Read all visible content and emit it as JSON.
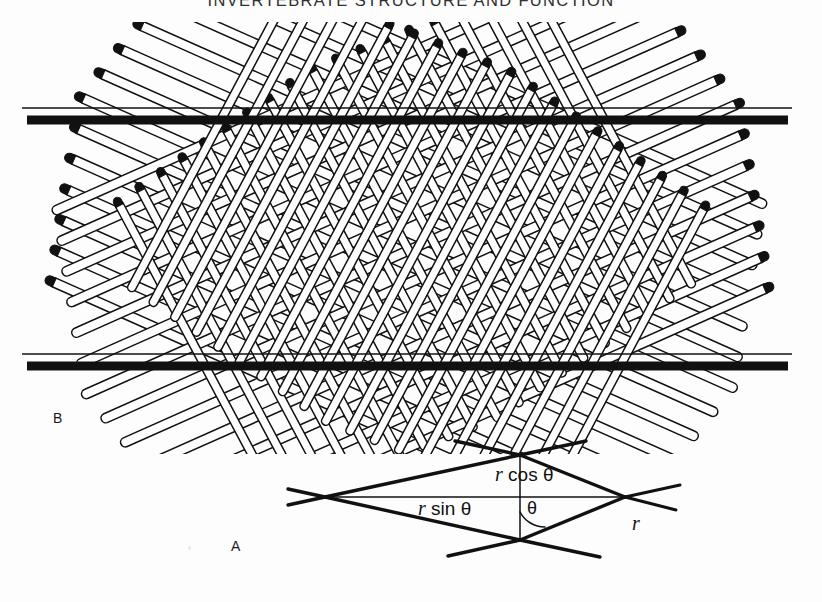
{
  "page": {
    "running_head": "INVERTEBRATE STRUCTURE AND FUNCTION",
    "width": 822,
    "height": 602,
    "background_color": "#fdfdfd",
    "ink_color": "#111111"
  },
  "panels": {
    "b": {
      "letter": "B",
      "caption_hint": "crossed-fibre lattice between two cuticle layers"
    },
    "a": {
      "letter": "A",
      "caption_hint": "geometry of a single fibre turn"
    }
  },
  "diagram_a": {
    "labels": {
      "r_cos_theta": {
        "var": "r",
        "rest": " cos θ"
      },
      "r_sin_theta": {
        "var": "r",
        "rest": " sin θ"
      },
      "theta": "θ",
      "r": "r"
    }
  },
  "chart_data": {
    "type": "diagram",
    "title": "INVERTEBRATE STRUCTURE AND FUNCTION",
    "panels": [
      {
        "id": "B",
        "label": "B",
        "description": "Crossed-helix fibre lattice bounded by two horizontal cuticle bars",
        "bars": [
          {
            "name": "upper-cuticle-bar",
            "y": 120,
            "x0": 27,
            "x1": 788,
            "thickness": 9
          },
          {
            "name": "lower-cuticle-bar",
            "y": 366,
            "x0": 27,
            "x1": 788,
            "thickness": 9
          }
        ],
        "fibre_families": [
          {
            "name": "shallow-down",
            "angle_deg": 24,
            "count": 13,
            "style": "hollow-tube"
          },
          {
            "name": "shallow-up",
            "angle_deg": -24,
            "count": 13,
            "style": "hollow-tube"
          },
          {
            "name": "steep-down",
            "angle_deg": 62,
            "count": 17,
            "style": "hollow-tube"
          },
          {
            "name": "steep-up",
            "angle_deg": -62,
            "count": 17,
            "style": "hollow-tube"
          }
        ]
      },
      {
        "id": "A",
        "label": "A",
        "description": "Rhombus showing one fibre turn with radius r and helix angle theta",
        "annotations": [
          "r cos θ",
          "r sin θ",
          "θ",
          "r"
        ]
      }
    ]
  }
}
